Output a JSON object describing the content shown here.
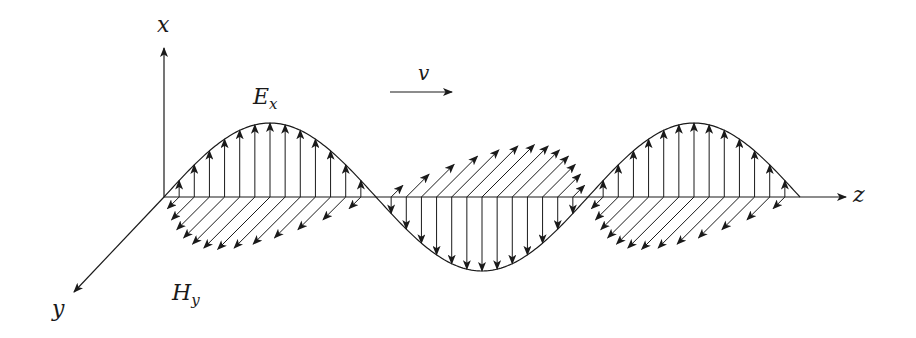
{
  "figure": {
    "ink_color": "#1a1a1a",
    "background": "#ffffff"
  },
  "labels": {
    "x_axis": "x",
    "y_axis": "y",
    "z_axis": "z",
    "electric_field": "E",
    "electric_field_sub": "x",
    "magnetic_field": "H",
    "magnetic_field_sub": "y",
    "velocity": "v"
  },
  "geometry": {
    "origin": [
      164,
      197
    ],
    "z_axis_end": [
      846,
      197
    ],
    "x_axis_end": [
      164,
      48
    ],
    "y_axis_end": [
      74,
      292
    ],
    "wave_start_z": 164,
    "half_wavelength_px": 212,
    "half_cycles": 3,
    "e_amplitude_px": 74,
    "h_amplitude_px": 74,
    "h_direction": [
      -0.707,
      0.707
    ],
    "arrows_per_half_cycle": 14,
    "velocity_arrow": {
      "from": [
        390,
        92
      ],
      "to": [
        452,
        92
      ]
    }
  }
}
